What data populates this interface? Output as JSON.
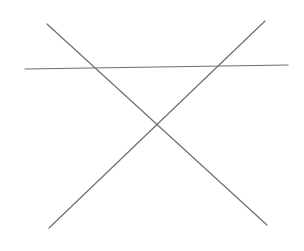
{
  "canvas": {
    "width": 304,
    "height": 251,
    "background": "#ffffff"
  },
  "line_color": "#6e6e6e",
  "lines": [
    {
      "name": "horizontal-line",
      "x1": 25,
      "y1": 69,
      "x2": 288,
      "y2": 65
    },
    {
      "name": "descending-diagonal-line",
      "x1": 47,
      "y1": 24,
      "x2": 267,
      "y2": 225
    },
    {
      "name": "ascending-diagonal-line",
      "x1": 49,
      "y1": 228,
      "x2": 265,
      "y2": 21
    }
  ]
}
